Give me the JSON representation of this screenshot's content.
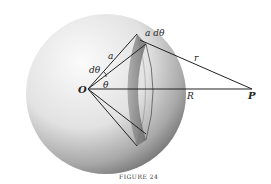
{
  "figure": {
    "caption": "FIGURE 24",
    "labels": {
      "origin": "O",
      "point": "P",
      "radius_a": "a",
      "distance_r": "r",
      "distance_R": "R",
      "angle_theta": "θ",
      "angle_dtheta": "dθ",
      "arc_width": "a dθ"
    },
    "colors": {
      "sphere_light": "#f4f4f4",
      "sphere_dark": "#8a8a8a",
      "band": "#6e6e6e",
      "line": "#222222"
    }
  }
}
